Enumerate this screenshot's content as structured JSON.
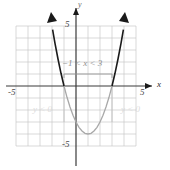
{
  "figure": {
    "axis_labels": {
      "x": "x",
      "y": "y"
    },
    "tick_labels": {
      "x_neg": "-5",
      "x_pos": "5",
      "y_pos": "5",
      "y_neg": "-5"
    },
    "annotations": {
      "interval": "−1 < x < 3",
      "region_left": "y < 0",
      "region_right": "y < 0"
    },
    "colors": {
      "grid": "#c9c9c9",
      "axis": "#3a3a3a",
      "curve_above": "#1a1a1a",
      "curve_below": "#a0a0a0",
      "annotation": "#8e8e8e",
      "region_text": "#d2d2d2",
      "background": "#ffffff"
    }
  },
  "chart_data": {
    "type": "line",
    "title": "",
    "xlabel": "x",
    "ylabel": "y",
    "xlim": [
      -5,
      5
    ],
    "ylim": [
      -5,
      5
    ],
    "grid": true,
    "legend": false,
    "xticks": [
      -5,
      5
    ],
    "yticks": [
      -5,
      5
    ],
    "function": "y = x^2 - 2x - 3",
    "roots": [
      -1,
      3
    ],
    "vertex": [
      1,
      -4
    ],
    "series": [
      {
        "name": "y = x^2 - 2x - 3",
        "x": [
          -1.95,
          -1.75,
          -1.5,
          -1.25,
          -1,
          -0.75,
          -0.5,
          -0.25,
          0,
          0.25,
          0.5,
          0.75,
          1,
          1.25,
          1.5,
          1.75,
          2,
          2.25,
          2.5,
          2.75,
          3,
          3.25,
          3.5,
          3.75,
          3.95
        ],
        "values": [
          4.7,
          3.56,
          2.25,
          1.06,
          0,
          -0.94,
          -1.75,
          -2.44,
          -3,
          -3.44,
          -3.75,
          -3.94,
          -4,
          -3.94,
          -3.75,
          -3.44,
          -3,
          -2.44,
          -1.75,
          -0.94,
          0,
          1.06,
          2.25,
          3.56,
          4.7
        ]
      }
    ],
    "annotations": [
      {
        "text": "−1 < x < 3",
        "x": 1,
        "y": 1.6,
        "note": "solution interval where y < 0"
      },
      {
        "text": "y < 0",
        "x": -3.1,
        "y": -2.0,
        "note": "left region label"
      },
      {
        "text": "y < 0",
        "x": 3.3,
        "y": -2.0,
        "note": "right region label"
      }
    ]
  }
}
